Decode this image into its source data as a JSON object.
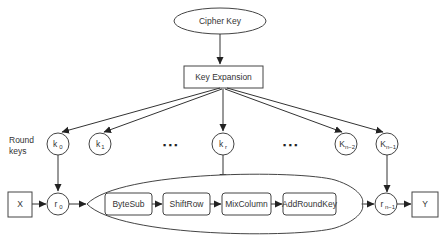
{
  "diagram": {
    "type": "aes-key-schedule-flow",
    "cipher_key": {
      "label": "Cipher Key"
    },
    "key_expansion": {
      "label": "Key Expansion"
    },
    "round_keys_label": {
      "line1": "Round",
      "line2": "keys"
    },
    "round_keys": [
      {
        "base": "k",
        "sub": "0"
      },
      {
        "base": "k",
        "sub": "1"
      },
      {
        "base": "k",
        "sub": "r"
      },
      {
        "base": "K",
        "sub": "n−2"
      },
      {
        "base": "K",
        "sub": "n−1"
      }
    ],
    "ellipsis": "▪ ▪ ▪",
    "input": {
      "label": "X"
    },
    "output": {
      "label": "Y"
    },
    "round_states": [
      {
        "base": "r",
        "sub": "0"
      },
      {
        "base": "r",
        "sub": "n−1"
      }
    ],
    "round_steps": [
      {
        "label": "ByteSub"
      },
      {
        "label": "ShiftRow"
      },
      {
        "label": "MixColumn"
      },
      {
        "label": "AddRoundKey"
      }
    ],
    "colors": {
      "stroke": "#444444",
      "text": "#333333",
      "background": "#ffffff"
    }
  }
}
